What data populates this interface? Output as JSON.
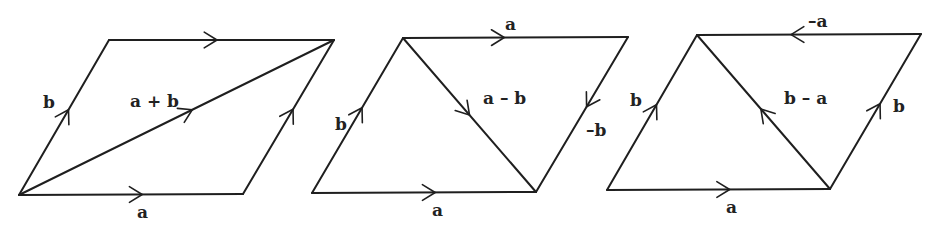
{
  "figure": {
    "width": 937,
    "height": 230,
    "stroke_color": "#1f1f1f",
    "label_color": "#222222",
    "background": "#ffffff"
  },
  "diagrams": [
    {
      "id": "sum",
      "title": "parallelogram-a-plus-b",
      "vertices": {
        "bl": [
          19,
          195
        ],
        "br": [
          243,
          194
        ],
        "tl": [
          109,
          40
        ],
        "tr": [
          334,
          40
        ]
      },
      "edges": [
        {
          "name": "bottom-a",
          "from": "bl",
          "to": "br",
          "arrow_t": 0.55,
          "label": "a",
          "label_xy": [
            137,
            218
          ]
        },
        {
          "name": "left-b",
          "from": "bl",
          "to": "tl",
          "arrow_t": 0.55,
          "label": "b",
          "label_xy": [
            43,
            108
          ]
        },
        {
          "name": "top-a",
          "from": "tl",
          "to": "tr",
          "arrow_t": 0.48,
          "label": "",
          "label_xy": [
            0,
            0
          ]
        },
        {
          "name": "right-b",
          "from": "br",
          "to": "tr",
          "arrow_t": 0.55,
          "label": "",
          "label_xy": [
            0,
            0
          ]
        },
        {
          "name": "diagonal-a-plus-b",
          "from": "bl",
          "to": "tr",
          "arrow_t": 0.55,
          "label": "a + b",
          "label_xy": [
            130,
            107
          ]
        }
      ]
    },
    {
      "id": "difference-a-minus-b",
      "title": "parallelogram-a-minus-b",
      "vertices": {
        "bl": [
          312,
          193
        ],
        "br": [
          536,
          192
        ],
        "tl": [
          403,
          38
        ],
        "tr": [
          628,
          37
        ]
      },
      "edges": [
        {
          "name": "bottom-a",
          "from": "bl",
          "to": "br",
          "arrow_t": 0.55,
          "label": "a",
          "label_xy": [
            432,
            216
          ]
        },
        {
          "name": "left-b",
          "from": "bl",
          "to": "tl",
          "arrow_t": 0.55,
          "label": "b",
          "label_xy": [
            335,
            130
          ]
        },
        {
          "name": "top-a",
          "from": "tl",
          "to": "tr",
          "arrow_t": 0.45,
          "label": "a",
          "label_xy": [
            505,
            30
          ]
        },
        {
          "name": "right-minus-b",
          "from": "tr",
          "to": "br",
          "arrow_t": 0.45,
          "label": "–b",
          "label_xy": [
            586,
            136
          ]
        },
        {
          "name": "diagonal-a-minus-b",
          "from": "tl",
          "to": "br",
          "arrow_t": 0.5,
          "label": "a – b",
          "label_xy": [
            483,
            104
          ]
        }
      ]
    },
    {
      "id": "difference-b-minus-a",
      "title": "parallelogram-b-minus-a",
      "vertices": {
        "bl": [
          607,
          190
        ],
        "br": [
          830,
          189
        ],
        "tl": [
          697,
          35
        ],
        "tr": [
          921,
          34
        ]
      },
      "edges": [
        {
          "name": "bottom-a",
          "from": "bl",
          "to": "br",
          "arrow_t": 0.55,
          "label": "a",
          "label_xy": [
            726,
            213
          ]
        },
        {
          "name": "left-b",
          "from": "bl",
          "to": "tl",
          "arrow_t": 0.55,
          "label": "b",
          "label_xy": [
            630,
            106
          ]
        },
        {
          "name": "top-minus-a",
          "from": "tr",
          "to": "tl",
          "arrow_t": 0.58,
          "label": "–a",
          "label_xy": [
            808,
            27
          ]
        },
        {
          "name": "right-b",
          "from": "br",
          "to": "tr",
          "arrow_t": 0.55,
          "label": "b",
          "label_xy": [
            893,
            112
          ]
        },
        {
          "name": "diagonal-b-minus-a",
          "from": "br",
          "to": "tl",
          "arrow_t": 0.52,
          "label": "b – a",
          "label_xy": [
            784,
            104
          ]
        }
      ]
    }
  ]
}
